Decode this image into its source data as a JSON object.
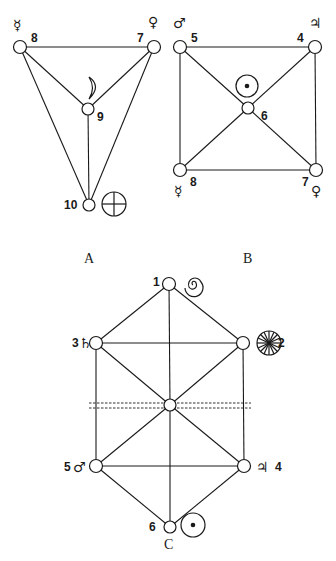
{
  "diagrams": [
    {
      "caption": "A",
      "nodes": [
        {
          "id": "8",
          "label": "8",
          "planet": "Mercury",
          "symbol": "☿"
        },
        {
          "id": "7",
          "label": "7",
          "planet": "Venus",
          "symbol": "♀"
        },
        {
          "id": "9",
          "label": "9",
          "planet": "Moon",
          "symbol": "☾"
        },
        {
          "id": "10",
          "label": "10",
          "planet": "Earth",
          "symbol": "⊕"
        }
      ],
      "edges": [
        [
          "8",
          "7"
        ],
        [
          "8",
          "9"
        ],
        [
          "7",
          "9"
        ],
        [
          "8",
          "10"
        ],
        [
          "7",
          "10"
        ],
        [
          "9",
          "10"
        ]
      ]
    },
    {
      "caption": "B",
      "nodes": [
        {
          "id": "5",
          "label": "5",
          "planet": "Mars",
          "symbol": "♂"
        },
        {
          "id": "4",
          "label": "4",
          "planet": "Jupiter",
          "symbol": "♃"
        },
        {
          "id": "6",
          "label": "6",
          "planet": "Sun",
          "symbol": "☉"
        },
        {
          "id": "8",
          "label": "8",
          "planet": "Mercury",
          "symbol": "☿"
        },
        {
          "id": "7",
          "label": "7",
          "planet": "Venus",
          "symbol": "♀"
        }
      ],
      "edges": [
        [
          "5",
          "4"
        ],
        [
          "5",
          "8"
        ],
        [
          "4",
          "7"
        ],
        [
          "8",
          "7"
        ],
        [
          "5",
          "6"
        ],
        [
          "4",
          "6"
        ],
        [
          "8",
          "6"
        ],
        [
          "7",
          "6"
        ]
      ]
    },
    {
      "caption": "C",
      "nodes": [
        {
          "id": "1",
          "label": "1",
          "planet": "Spiral",
          "symbol": "spiral"
        },
        {
          "id": "2",
          "label": "2",
          "planet": "Wheel",
          "symbol": "wheel"
        },
        {
          "id": "3",
          "label": "3",
          "planet": "Saturn",
          "symbol": "♄"
        },
        {
          "id": "center",
          "label": "",
          "planet": "",
          "symbol": ""
        },
        {
          "id": "5",
          "label": "5",
          "planet": "Mars",
          "symbol": "♂"
        },
        {
          "id": "4",
          "label": "4",
          "planet": "Jupiter",
          "symbol": "♃"
        },
        {
          "id": "6",
          "label": "6",
          "planet": "Sun",
          "symbol": "☉"
        }
      ],
      "edges": [
        [
          "1",
          "3"
        ],
        [
          "1",
          "2"
        ],
        [
          "1",
          "center"
        ],
        [
          "3",
          "2"
        ],
        [
          "3",
          "center"
        ],
        [
          "2",
          "center"
        ],
        [
          "3",
          "5"
        ],
        [
          "2",
          "4"
        ],
        [
          "center",
          "5"
        ],
        [
          "center",
          "4"
        ],
        [
          "center",
          "6"
        ],
        [
          "5",
          "4"
        ],
        [
          "5",
          "6"
        ],
        [
          "4",
          "6"
        ]
      ],
      "dashed_lines": 2
    }
  ]
}
